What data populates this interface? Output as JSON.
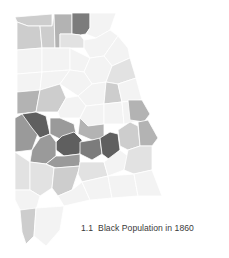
{
  "figure": {
    "number": "1.1",
    "title": "Black Population in 1860"
  },
  "map": {
    "region": "Alabama",
    "subject": "Black population by county",
    "year": "1860",
    "shading": "grayscale choropleth (darker = larger Black population)",
    "palette": {
      "level_0": "#f3f3f3",
      "level_1": "#e2e2e2",
      "level_2": "#cdcdcd",
      "level_3": "#b3b3b3",
      "level_4": "#9a9a9a",
      "level_5": "#7c7c7c",
      "level_6": "#5f5f5f"
    },
    "counties": [
      {
        "id": "nw1",
        "level": 2,
        "points": "15,17 52,14 52,26 28,26 17,22"
      },
      {
        "id": "nw2",
        "level": 2,
        "points": "17,22 28,26 40,26 42,48 17,50"
      },
      {
        "id": "nw3",
        "level": 2,
        "points": "40,26 52,26 54,14 55,48 42,48"
      },
      {
        "id": "n4",
        "level": 3,
        "points": "54,14 72,14 72,34 60,34 60,48 55,48"
      },
      {
        "id": "n5",
        "level": 5,
        "points": "72,13 90,13 90,28 86,34 80,35 72,34"
      },
      {
        "id": "n6",
        "level": 1,
        "points": "60,34 72,34 80,35 84,40 84,48 60,48"
      },
      {
        "id": "ne1",
        "level": 0,
        "points": "90,13 116,13 110,30 96,38 86,34 90,28"
      },
      {
        "id": "ne2",
        "level": 0,
        "points": "84,40 96,38 110,30 118,36 104,56 90,58 84,48"
      },
      {
        "id": "r2a",
        "level": 0,
        "points": "17,50 42,48 42,72 17,74"
      },
      {
        "id": "r2b",
        "level": 0,
        "points": "42,48 70,48 70,70 42,72"
      },
      {
        "id": "r2c",
        "level": 0,
        "points": "70,48 90,58 84,72 70,70"
      },
      {
        "id": "r2d",
        "level": 0,
        "points": "104,56 118,36 128,48 130,58 112,66"
      },
      {
        "id": "r2e",
        "level": 0,
        "points": "90,58 104,56 112,66 106,82 92,84 84,72"
      },
      {
        "id": "r2f",
        "level": 1,
        "points": "112,66 130,58 136,78 118,84 106,82"
      },
      {
        "id": "r3a",
        "level": 0,
        "points": "17,74 42,72 40,90 17,92"
      },
      {
        "id": "r3b",
        "level": 0,
        "points": "42,72 70,70 60,84 40,90"
      },
      {
        "id": "r3c",
        "level": 0,
        "points": "70,70 84,72 92,84 78,96 60,84"
      },
      {
        "id": "r3d",
        "level": 0,
        "points": "78,96 92,84 106,82 104,104 86,106"
      },
      {
        "id": "r3e",
        "level": 2,
        "points": "106,82 118,84 122,102 104,104"
      },
      {
        "id": "r3f",
        "level": 0,
        "points": "118,84 136,78 142,100 122,102"
      },
      {
        "id": "w1",
        "level": 3,
        "points": "17,92 40,90 36,112 17,114"
      },
      {
        "id": "w2",
        "level": 2,
        "points": "40,90 60,84 66,98 58,112 36,112"
      },
      {
        "id": "c1",
        "level": 0,
        "points": "58,112 66,98 78,96 86,106 80,118 60,118"
      },
      {
        "id": "c2",
        "level": 0,
        "points": "86,106 104,104 104,124 88,126 80,118"
      },
      {
        "id": "c3",
        "level": 0,
        "points": "104,104 122,102 124,124 104,124"
      },
      {
        "id": "e1",
        "level": 0,
        "points": "122,102 142,100 144,120 124,124"
      },
      {
        "id": "e2",
        "level": 3,
        "points": "128,100 142,100 150,114 144,122 130,120"
      },
      {
        "id": "w3",
        "level": 4,
        "points": "15,118 22,114 36,112 40,128 32,150 15,152"
      },
      {
        "id": "w4",
        "level": 6,
        "points": "22,114 36,112 46,116 50,134 40,138 32,128"
      },
      {
        "id": "c4",
        "level": 4,
        "points": "50,118 60,118 74,124 76,134 62,140 50,134"
      },
      {
        "id": "c5",
        "level": 3,
        "points": "80,118 88,126 104,124 104,138 92,140 78,134"
      },
      {
        "id": "c6",
        "level": 6,
        "points": "56,142 62,136 74,132 82,140 80,154 64,156 56,150"
      },
      {
        "id": "c7",
        "level": 5,
        "points": "80,142 92,140 100,138 102,154 92,160 80,154"
      },
      {
        "id": "c8",
        "level": 6,
        "points": "100,138 110,132 118,134 120,150 110,160 102,154"
      },
      {
        "id": "e3",
        "level": 2,
        "points": "118,130 130,122 138,126 140,146 128,150 120,146"
      },
      {
        "id": "e4",
        "level": 3,
        "points": "138,122 148,120 158,138 152,146 140,146"
      },
      {
        "id": "w5",
        "level": 4,
        "points": "32,150 40,138 50,134 56,142 56,156 46,164 30,162"
      },
      {
        "id": "c9",
        "level": 4,
        "points": "46,164 56,156 64,156 80,154 80,166 56,168"
      },
      {
        "id": "s1",
        "level": 1,
        "points": "15,152 30,162 30,190 15,190"
      },
      {
        "id": "s2",
        "level": 1,
        "points": "30,162 46,164 54,168 52,188 40,196 30,190"
      },
      {
        "id": "s3",
        "level": 2,
        "points": "54,168 80,166 72,190 58,196 52,188"
      },
      {
        "id": "s4",
        "level": 1,
        "points": "80,162 104,162 108,176 82,182 78,174"
      },
      {
        "id": "s5",
        "level": 0,
        "points": "104,162 120,150 128,156 124,170 108,176"
      },
      {
        "id": "s6",
        "level": 1,
        "points": "128,150 140,146 152,146 152,170 134,174 124,170"
      },
      {
        "id": "s7",
        "level": 0,
        "points": "15,190 30,190 40,196 36,210 20,210 15,200"
      },
      {
        "id": "s8",
        "level": 0,
        "points": "58,196 72,190 82,182 90,200 64,206"
      },
      {
        "id": "s9",
        "level": 0,
        "points": "82,182 108,176 112,198 90,200"
      },
      {
        "id": "s10",
        "level": 0,
        "points": "108,176 134,174 138,196 112,198"
      },
      {
        "id": "s11",
        "level": 0,
        "points": "134,174 152,170 162,196 138,196"
      },
      {
        "id": "sw1",
        "level": 2,
        "points": "20,210 36,208 34,236 26,244 22,232"
      },
      {
        "id": "sw2",
        "level": 0,
        "points": "36,208 64,206 60,230 46,246 34,236"
      }
    ]
  }
}
